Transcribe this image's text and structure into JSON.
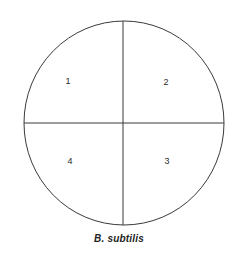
{
  "figure": {
    "type": "petri-dish-quadrant-streak-diagram",
    "caption": "B. subtilis",
    "background_color": "#ffffff",
    "line_color": "#3a3a3a",
    "label_color": "#2b2b2b",
    "plate": {
      "shape": "circle",
      "center_x": 124,
      "center_y": 123,
      "radius_x": 100,
      "radius_y": 102,
      "stroke_width": 1
    },
    "dividers": [
      {
        "name": "vertical-divider",
        "orientation": "vertical",
        "x": 123
      },
      {
        "name": "horizontal-divider",
        "orientation": "horizontal",
        "y": 123
      }
    ],
    "quadrants": [
      {
        "id": "q1",
        "label": "1",
        "position": "upper-left"
      },
      {
        "id": "q2",
        "label": "2",
        "position": "upper-right"
      },
      {
        "id": "q3",
        "label": "3",
        "position": "lower-right"
      },
      {
        "id": "q4",
        "label": "4",
        "position": "lower-left"
      }
    ]
  }
}
